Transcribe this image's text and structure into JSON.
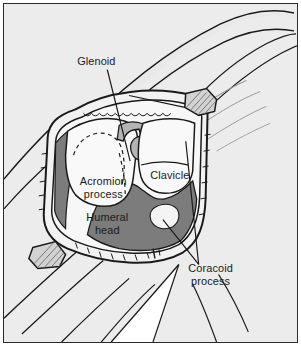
{
  "figure": {
    "kind": "anatomical-illustration",
    "view": "open surgical field showing shoulder girdle bones",
    "frame": {
      "border_color": "#2b2b2b",
      "background_color": "#ececec",
      "width": 301,
      "height": 346
    },
    "palette": {
      "skin_fill": "#e9e9e9",
      "bone_fill": "#f7f7f7",
      "deep_tissue_fill": "#7c7c7c",
      "mid_tissue_fill": "#b4b4b4",
      "gauze_fill": "#d2d2d2",
      "line_color": "#1a1a1a",
      "label_color": "#1a1a1a"
    }
  },
  "labels": [
    {
      "id": "glenoid",
      "text": "Glenoid",
      "lines": [
        "Glenoid"
      ],
      "x": 93,
      "y": 61,
      "align": "middle",
      "leader": {
        "from_x": 104,
        "from_y": 66,
        "to_x": 127,
        "to_y": 158
      }
    },
    {
      "id": "acromion-process",
      "text": "Acromion process",
      "lines": [
        "Acromion",
        "process"
      ],
      "x": 100,
      "y": 182,
      "align": "middle",
      "leader": null
    },
    {
      "id": "clavicle",
      "text": "Clavicle",
      "lines": [
        "Clavicle"
      ],
      "x": 167,
      "y": 176,
      "align": "middle",
      "leader": null
    },
    {
      "id": "humeral-head",
      "text": "Humeral head",
      "lines": [
        "Humeral",
        "head"
      ],
      "x": 104,
      "y": 218,
      "align": "middle",
      "leader": null
    },
    {
      "id": "coracoid-process",
      "text": "Coracoid process",
      "lines": [
        "Coracoid",
        "process"
      ],
      "x": 208,
      "y": 270,
      "align": "middle",
      "leader": {
        "from_x": 196,
        "from_y": 262,
        "to_x": 160,
        "to_y": 217
      }
    }
  ],
  "structures": [
    {
      "id": "arm-limb",
      "name": "abducted arm / upper limb",
      "shading": "skin"
    },
    {
      "id": "wound-edge",
      "name": "retracted skin incision edge",
      "shading": "outline"
    },
    {
      "id": "gauze-upper",
      "name": "upper retractor pad",
      "shading": "gauze"
    },
    {
      "id": "gauze-lower",
      "name": "lower retractor pad",
      "shading": "gauze"
    },
    {
      "id": "glenoid-surface",
      "name": "glenoid fossa",
      "shading": "mid"
    },
    {
      "id": "humeral-head-bone",
      "name": "humeral head",
      "shading": "bone"
    },
    {
      "id": "clavicle-bone",
      "name": "clavicle",
      "shading": "bone"
    },
    {
      "id": "acromion-bone",
      "name": "acromion process",
      "shading": "bone"
    },
    {
      "id": "coracoid-region",
      "name": "coracoid process / deep tissue",
      "shading": "deep"
    }
  ]
}
